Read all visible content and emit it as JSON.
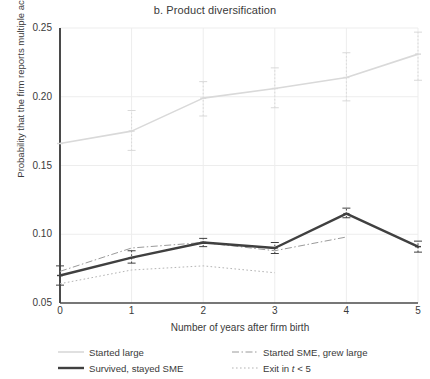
{
  "chart_data": {
    "type": "line",
    "title": "b. Product diversification",
    "xlabel": "Number of years after firm birth",
    "ylabel": "Probability that the firm reports multiple activity codes",
    "x": [
      0,
      1,
      2,
      3,
      4,
      5
    ],
    "xticks": [
      "0",
      "1",
      "2",
      "3",
      "4",
      "5"
    ],
    "yticks": [
      "0.05",
      "0.10",
      "0.15",
      "0.20",
      "0.25"
    ],
    "ytick_values": [
      0.05,
      0.1,
      0.15,
      0.2,
      0.25
    ],
    "xlim": [
      0,
      5
    ],
    "ylim": [
      0.05,
      0.25
    ],
    "grid": true,
    "legend_position": "below",
    "series": [
      {
        "name": "Started large",
        "style": "solid-thin-light",
        "color": "#d9d9d9",
        "x": [
          0,
          1,
          2,
          3,
          4,
          5
        ],
        "values": [
          0.166,
          0.175,
          0.199,
          0.206,
          0.214,
          0.231
        ],
        "err_low": [
          0.166,
          0.161,
          0.186,
          0.192,
          0.197,
          0.212
        ],
        "err_high": [
          0.166,
          0.19,
          0.211,
          0.221,
          0.232,
          0.247
        ],
        "has_error_bars": true
      },
      {
        "name": "Started SME, grew large",
        "style": "dash-dot",
        "color": "#9a9a9a",
        "x": [
          0,
          1,
          2,
          3,
          4
        ],
        "values": [
          0.073,
          0.09,
          0.094,
          0.088,
          0.098
        ],
        "err_low": [
          0.062,
          0.078,
          0.083,
          0.077,
          0.09
        ],
        "err_high": [
          0.084,
          0.102,
          0.105,
          0.099,
          0.106
        ],
        "has_error_bars": false
      },
      {
        "name": "Survived, stayed SME",
        "style": "solid-thick-dark",
        "color": "#404040",
        "x": [
          0,
          1,
          2,
          3,
          4,
          5
        ],
        "values": [
          0.07,
          0.083,
          0.094,
          0.09,
          0.115,
          0.091
        ],
        "err_low": [
          0.063,
          0.079,
          0.091,
          0.086,
          0.112,
          0.087
        ],
        "err_high": [
          0.077,
          0.088,
          0.097,
          0.094,
          0.119,
          0.095
        ],
        "has_error_bars": true
      },
      {
        "name": "Exit in t < 5",
        "style": "dotted",
        "color": "#b4b4b4",
        "x": [
          0,
          1,
          2,
          3
        ],
        "values": [
          0.064,
          0.074,
          0.077,
          0.072
        ],
        "err_low": [
          0.058,
          0.07,
          0.073,
          0.068
        ],
        "err_high": [
          0.07,
          0.079,
          0.082,
          0.077
        ],
        "has_error_bars": false
      }
    ]
  },
  "legend": {
    "items": [
      {
        "label": "Started large",
        "swatch": "solid-thin-light"
      },
      {
        "label": "Started SME, grew large",
        "swatch": "dash-dot"
      },
      {
        "label": "Survived, stayed SME",
        "swatch": "solid-thick-dark"
      },
      {
        "label_pre": "Exit in ",
        "label_em": "t",
        "label_post": " < 5",
        "swatch": "dotted"
      }
    ]
  }
}
